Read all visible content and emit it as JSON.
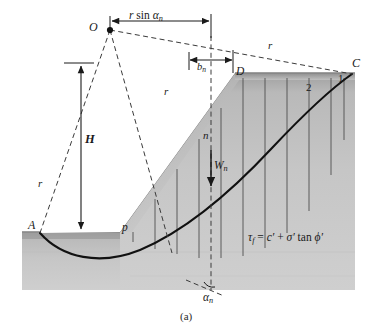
{
  "figure": {
    "caption": "(a)",
    "kind": "slope-stability-method-of-slices"
  },
  "points": {
    "center_of_rotation": "O",
    "toe_left": "A",
    "slope_base": "p",
    "slope_crest": "D",
    "ground_right": "C"
  },
  "dimensions": {
    "top_span_label_r": "r",
    "top_span_label_sin": "sin",
    "top_span_label_alpha": "α",
    "top_span_label_alpha_sub": "n",
    "slice_width_label": "b",
    "slice_width_sub": "n",
    "height_label": "H"
  },
  "radii": {
    "left_label": "r",
    "mid_label": "r",
    "right_label": "r"
  },
  "slices": {
    "current_label": "n",
    "weight_label": "W",
    "weight_sub": "n",
    "numbered": [
      "1",
      "2"
    ],
    "angle_label": "α",
    "angle_sub": "n"
  },
  "equation": {
    "tau": "τ",
    "tau_sub": "f",
    "equals": "=",
    "cohesion": "c′",
    "plus": "+",
    "sigma": "σ′",
    "tan": "tan",
    "phi": "ϕ′",
    "full": "τf = c′ + σ′ tan ϕ′"
  },
  "colors": {
    "soil_top": "#b4b4b4",
    "soil_bottom": "#c9c9c9",
    "slip_surface": "#111111",
    "dashed": "#3a3a3a",
    "slice_line": "#4a4a4a",
    "page": "#ffffff"
  }
}
